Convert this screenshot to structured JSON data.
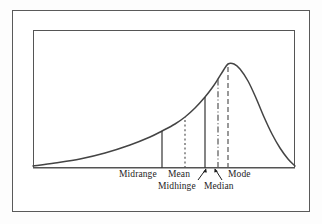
{
  "figure": {
    "type": "statistics-distribution-diagram"
  },
  "labels": {
    "midrange": "Midrange",
    "mean": "Mean",
    "midhinge": "Midhinge",
    "median": "Median",
    "mode": "Mode"
  },
  "colors": {
    "curve": "#444444",
    "frame": "#555555",
    "outer_border": "#5a5a5a",
    "text": "#1d1d1d",
    "background": "#ffffff"
  },
  "chart_data": {
    "type": "line",
    "title": "",
    "xlabel": "",
    "ylabel": "",
    "grid": false,
    "legend": "none",
    "xlim": [
      33,
      295
    ],
    "ylim": [
      168,
      64
    ],
    "curve_description": "Smooth unimodal negatively skewed density curve rising slowly from the left baseline and falling steeply to the right of the peak",
    "baseline_y": 168,
    "peak": {
      "x": 228,
      "y": 64
    },
    "curve_points": [
      {
        "x": 33,
        "y": 166
      },
      {
        "x": 55,
        "y": 163
      },
      {
        "x": 80,
        "y": 159
      },
      {
        "x": 105,
        "y": 153
      },
      {
        "x": 130,
        "y": 145
      },
      {
        "x": 150,
        "y": 137
      },
      {
        "x": 162,
        "y": 131
      },
      {
        "x": 175,
        "y": 124
      },
      {
        "x": 185,
        "y": 117
      },
      {
        "x": 195,
        "y": 108
      },
      {
        "x": 205,
        "y": 97
      },
      {
        "x": 212,
        "y": 88
      },
      {
        "x": 218,
        "y": 79
      },
      {
        "x": 223,
        "y": 71
      },
      {
        "x": 228,
        "y": 64
      },
      {
        "x": 234,
        "y": 64
      },
      {
        "x": 240,
        "y": 69
      },
      {
        "x": 248,
        "y": 81
      },
      {
        "x": 256,
        "y": 98
      },
      {
        "x": 264,
        "y": 117
      },
      {
        "x": 272,
        "y": 134
      },
      {
        "x": 280,
        "y": 148
      },
      {
        "x": 288,
        "y": 159
      },
      {
        "x": 295,
        "y": 166
      }
    ],
    "markers": [
      {
        "name": "Midrange",
        "x": 162,
        "top_y": 131,
        "style": "solid"
      },
      {
        "name": "Mean",
        "x": 185,
        "top_y": 117,
        "style": "dotted"
      },
      {
        "name": "Midhinge",
        "x": 205,
        "top_y": 97,
        "style": "solid"
      },
      {
        "name": "Median",
        "x": 218,
        "top_y": 79,
        "style": "dash-dot"
      },
      {
        "name": "Mode",
        "x": 228,
        "top_y": 64,
        "style": "dashed"
      }
    ],
    "leader_arrows": [
      {
        "name": "Midhinge",
        "points_to_x": 205,
        "direction": "up-right"
      },
      {
        "name": "Median",
        "points_to_x": 218,
        "direction": "up-left"
      }
    ]
  }
}
